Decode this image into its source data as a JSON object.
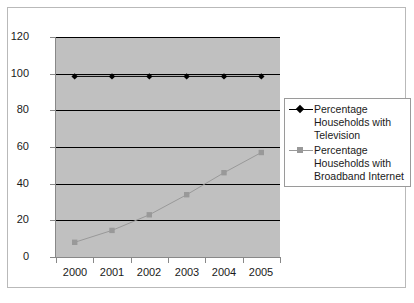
{
  "chart_data": {
    "type": "line",
    "title": "",
    "xlabel": "",
    "ylabel": "",
    "categories": [
      "2000",
      "2001",
      "2002",
      "2003",
      "2004",
      "2005"
    ],
    "series": [
      {
        "name": "Percentage Households with Television",
        "marker": "diamond",
        "color": "#000000",
        "values": [
          98.5,
          98.5,
          98.5,
          98.5,
          98.5,
          98.5
        ]
      },
      {
        "name": "Percentage Households with Broadband Internet",
        "marker": "square",
        "color": "#999999",
        "values": [
          8,
          14.5,
          23,
          34,
          46,
          57
        ]
      }
    ],
    "ylim": [
      0,
      120
    ],
    "yticks": [
      0,
      20,
      40,
      60,
      80,
      100,
      120
    ],
    "ytick_labels": [
      "0",
      "20",
      "40",
      "60",
      "80",
      "100",
      "120"
    ],
    "grid": true,
    "legend_position": "right",
    "plot_background": "#c0c0c0",
    "gridline_color": "#000000"
  },
  "legend": {
    "entries": [
      {
        "label": "Percentage Households with Television"
      },
      {
        "label": "Percentage Households with Broadband Internet"
      }
    ]
  }
}
